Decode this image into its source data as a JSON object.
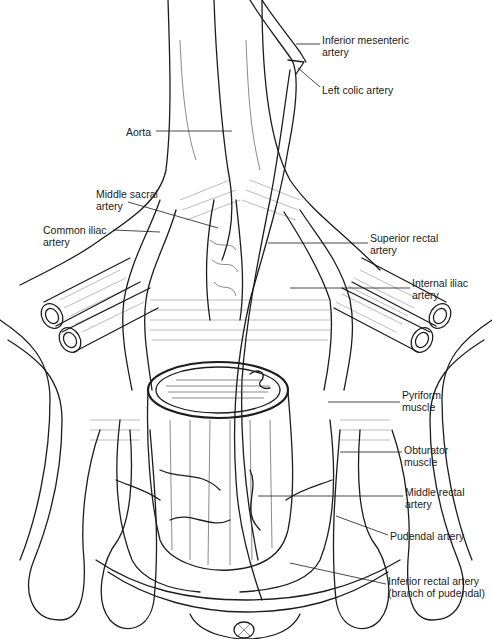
{
  "figure": {
    "labels": [
      {
        "id": "inferior-mesenteric-artery",
        "text": "Inferior mesenteric\nartery",
        "x": 322,
        "y": 34,
        "lx1": 296,
        "ly1": 44,
        "lx2": 320,
        "ly2": 44
      },
      {
        "id": "left-colic-artery",
        "text": "Left colic artery",
        "x": 322,
        "y": 84,
        "lx1": 298,
        "ly1": 68,
        "lx2": 320,
        "ly2": 87
      },
      {
        "id": "aorta",
        "text": "Aorta",
        "x": 126,
        "y": 126,
        "lx1": 156,
        "ly1": 131,
        "lx2": 232,
        "ly2": 131
      },
      {
        "id": "middle-sacral-artery",
        "text": "Middle sacral\nartery",
        "x": 96,
        "y": 188,
        "lx1": 128,
        "ly1": 202,
        "lx2": 218,
        "ly2": 228
      },
      {
        "id": "common-iliac-artery",
        "text": "Common iliac\nartery",
        "x": 43,
        "y": 224,
        "lx1": 113,
        "ly1": 230,
        "lx2": 160,
        "ly2": 232
      },
      {
        "id": "superior-rectal-artery",
        "text": "Superior rectal\nartery",
        "x": 370,
        "y": 232,
        "lx1": 268,
        "ly1": 243,
        "lx2": 368,
        "ly2": 243
      },
      {
        "id": "internal-iliac-artery",
        "text": "Internal iliac\nartery",
        "x": 412,
        "y": 277,
        "lx1": 290,
        "ly1": 288,
        "lx2": 410,
        "ly2": 288
      },
      {
        "id": "pyriform-muscle",
        "text": "Pyriform\nmuscle",
        "x": 402,
        "y": 389,
        "lx1": 328,
        "ly1": 402,
        "lx2": 400,
        "ly2": 402
      },
      {
        "id": "obturator-muscle",
        "text": "Obturator\nmuscle",
        "x": 404,
        "y": 444,
        "lx1": 340,
        "ly1": 452,
        "lx2": 402,
        "ly2": 452
      },
      {
        "id": "middle-rectal-artery",
        "text": "Middle rectal\nartery",
        "x": 405,
        "y": 486,
        "lx1": 258,
        "ly1": 496,
        "lx2": 403,
        "ly2": 496
      },
      {
        "id": "pudendal-artery",
        "text": "Pudendal artery",
        "x": 390,
        "y": 530,
        "lx1": 336,
        "ly1": 516,
        "lx2": 388,
        "ly2": 535
      },
      {
        "id": "inferior-rectal-artery",
        "text": "Inferior rectal artery\n(branch of pudendal)",
        "x": 388,
        "y": 575,
        "lx1": 290,
        "ly1": 563,
        "lx2": 386,
        "ly2": 584
      }
    ]
  },
  "colors": {
    "ink": "#1c1c1c",
    "background": "#ffffff"
  }
}
